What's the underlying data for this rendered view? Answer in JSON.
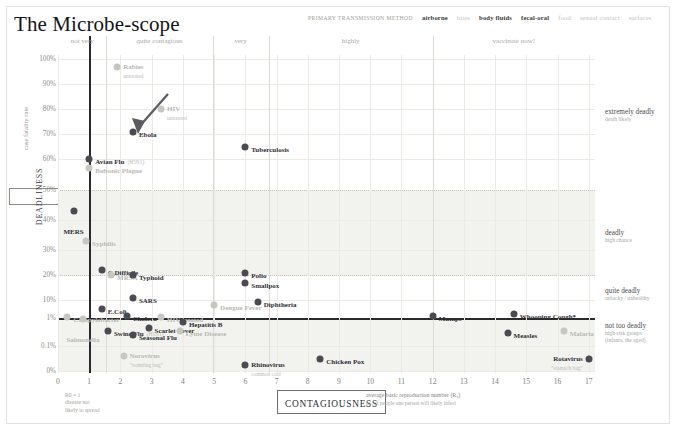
{
  "title": "The Microbe-scope",
  "legend": {
    "title": "PRIMARY TRANSMISSION METHOD",
    "items": [
      {
        "label": "airborne",
        "active": true
      },
      {
        "label": "bites",
        "active": false
      },
      {
        "label": "body fluids",
        "active": true
      },
      {
        "label": "fecal-oral",
        "active": true
      },
      {
        "label": "food",
        "active": false
      },
      {
        "label": "sexual contact",
        "active": false
      },
      {
        "label": "surfaces",
        "active": false
      }
    ]
  },
  "axes": {
    "y_title": "case fatality rate",
    "y_box_label": "DEADLINESS",
    "y_ticks": [
      "100%",
      "90%",
      "80%",
      "70%",
      "60%",
      "50%",
      "40%",
      "30%",
      "20%",
      "10%",
      "1%",
      "0.1%",
      "0%"
    ],
    "x_box_label": "CONTAGIOUSNESS",
    "x_ticks": [
      "0",
      "1",
      "2",
      "3",
      "4",
      "5",
      "6",
      "7",
      "8",
      "9",
      "10",
      "11",
      "12",
      "13",
      "14",
      "15",
      "16",
      "17"
    ],
    "x_note_line1": "average basic reproduction number (R₀)",
    "x_note_line2": "no. of people one person will likely infect",
    "r0_note": "R0 = 1\ndisease not\nlikely to spread"
  },
  "contagiousness_bands": [
    {
      "label": "not very",
      "x0": 0,
      "x1": 1.55
    },
    {
      "label": "quite contagious",
      "x0": 1.55,
      "x1": 4.95
    },
    {
      "label": "very",
      "x0": 4.95,
      "x1": 6.75
    },
    {
      "label": "highly",
      "x0": 6.75,
      "x1": 12.0
    },
    {
      "label": "vaccinate now!",
      "x0": 12.0,
      "x1": 17.2
    }
  ],
  "deadliness_bands": [
    {
      "label": "extremely deadly",
      "sub": "death likely"
    },
    {
      "label": "deadly",
      "sub": "high chance"
    },
    {
      "label": "quite deadly",
      "sub": "unlucky / unhealthy"
    },
    {
      "label": "not too deadly",
      "sub": "high-risk groups\n(infants, the aged)"
    }
  ],
  "chart_data": {
    "type": "scatter",
    "title": "The Microbe-scope",
    "xlabel": "CONTAGIOUSNESS — average basic reproduction number (R₀)",
    "ylabel": "DEADLINESS — case fatality rate",
    "xlim": [
      0,
      17.2
    ],
    "ylabel_scale": "piecewise: 0%, 0.1%, 1%, then linear 10%–100%",
    "grid": true,
    "legend_position": "top-right",
    "annotation_arrow_target": "Ebola",
    "points": [
      {
        "name": "Rabies",
        "sub": "untreated",
        "x": 1.9,
        "y_label": "97%",
        "transmission": "bites",
        "active": false,
        "label_side": "right"
      },
      {
        "name": "HIV",
        "sub": "untreated",
        "x": 3.3,
        "y_label": "80%",
        "transmission": "sexual contact",
        "active": false,
        "label_side": "right"
      },
      {
        "name": "Ebola",
        "sub": "",
        "x": 2.4,
        "y_label": "71%",
        "transmission": "body fluids",
        "active": true,
        "label_side": "right"
      },
      {
        "name": "Tuberculosis",
        "sub": "",
        "x": 6.0,
        "y_label": "65%",
        "transmission": "airborne",
        "active": true,
        "label_side": "right"
      },
      {
        "name": "Avian Flu",
        "sub": "(H5N1)",
        "x": 1.0,
        "y_label": "60%",
        "transmission": "airborne",
        "active": true,
        "label_side": "right"
      },
      {
        "name": "Bubonic Plague",
        "sub": "",
        "x": 1.0,
        "y_label": "57%",
        "transmission": "bites",
        "active": false,
        "label_side": "right"
      },
      {
        "name": "MERS",
        "sub": "",
        "x": 0.5,
        "y_label": "43%",
        "transmission": "airborne",
        "active": true,
        "label_side": "below"
      },
      {
        "name": "Syphilis",
        "sub": "",
        "x": 0.9,
        "y_label": "33%",
        "transmission": "sexual contact",
        "active": false,
        "label_side": "right"
      },
      {
        "name": "C.Difficile",
        "sub": "",
        "x": 1.4,
        "y_label": "22%",
        "transmission": "fecal-oral",
        "active": true,
        "label_side": "right"
      },
      {
        "name": "MRSA",
        "sub": "",
        "x": 1.7,
        "y_label": "20%",
        "transmission": "surfaces",
        "active": false,
        "label_side": "right"
      },
      {
        "name": "Typhoid",
        "sub": "",
        "x": 2.4,
        "y_label": "20%",
        "transmission": "fecal-oral",
        "active": true,
        "label_side": "right"
      },
      {
        "name": "Polio",
        "sub": "",
        "x": 6.0,
        "y_label": "21%",
        "transmission": "fecal-oral",
        "active": true,
        "label_side": "right"
      },
      {
        "name": "Smallpox",
        "sub": "",
        "x": 6.0,
        "y_label": "17%",
        "transmission": "airborne",
        "active": true,
        "label_side": "right"
      },
      {
        "name": "SARS",
        "sub": "",
        "x": 2.4,
        "y_label": "11%",
        "transmission": "airborne",
        "active": true,
        "label_side": "right"
      },
      {
        "name": "Dengue Fever",
        "sub": "",
        "x": 5.0,
        "y_label": "5%",
        "transmission": "bites",
        "active": false,
        "label_side": "right"
      },
      {
        "name": "Diphtheria",
        "sub": "",
        "x": 6.4,
        "y_label": "8%",
        "transmission": "airborne",
        "active": true,
        "label_side": "right"
      },
      {
        "name": "E.Coli",
        "sub": "",
        "x": 1.4,
        "y_label": "3%",
        "transmission": "fecal-oral",
        "active": true,
        "label_side": "right"
      },
      {
        "name": "Campylobacter",
        "sub": "",
        "x": 0.3,
        "y_label": "1.2%",
        "transmission": "food",
        "active": false,
        "label_side": "right"
      },
      {
        "name": "Salmonella",
        "sub": "",
        "x": 0.8,
        "y_label": "0.9%",
        "transmission": "food",
        "active": false,
        "label_side": "below"
      },
      {
        "name": "Cholera",
        "sub": "",
        "x": 2.2,
        "y_label": "1.3%",
        "transmission": "fecal-oral",
        "active": true,
        "label_side": "right"
      },
      {
        "name": "HIV treated",
        "sub": "",
        "x": 3.3,
        "y_label": "1.2%",
        "transmission": "sexual contact",
        "active": false,
        "label_side": "right"
      },
      {
        "name": "Mumps",
        "sub": "",
        "x": 12.0,
        "y_label": "1.3%",
        "transmission": "airborne",
        "active": true,
        "label_side": "right"
      },
      {
        "name": "Whooping Cough*",
        "sub": "",
        "x": 14.6,
        "y_label": "1.6%",
        "transmission": "airborne",
        "active": true,
        "label_side": "right"
      },
      {
        "name": "Hepatitis B",
        "sub": "",
        "x": 4.0,
        "y_label": "0.7%",
        "transmission": "body fluids",
        "active": true,
        "label_side": "right"
      },
      {
        "name": "Scarlet Fever",
        "sub": "",
        "x": 2.9,
        "y_label": "0.45%",
        "transmission": "airborne",
        "active": true,
        "label_side": "right"
      },
      {
        "name": "Swine Flu",
        "sub": "(H1N1)",
        "x": 1.6,
        "y_label": "0.35%",
        "transmission": "airborne",
        "active": true,
        "label_side": "right"
      },
      {
        "name": "Lyme Disease",
        "sub": "",
        "x": 3.9,
        "y_label": "0.35%",
        "transmission": "bites",
        "active": false,
        "label_side": "right"
      },
      {
        "name": "Seasonal Flu",
        "sub": "",
        "x": 2.4,
        "y_label": "0.25%",
        "transmission": "airborne",
        "active": true,
        "label_side": "right"
      },
      {
        "name": "Measles",
        "sub": "",
        "x": 14.4,
        "y_label": "0.3%",
        "transmission": "airborne",
        "active": true,
        "label_side": "right"
      },
      {
        "name": "Malaria",
        "sub": "",
        "x": 16.2,
        "y_label": "0.35%",
        "transmission": "bites",
        "active": false,
        "label_side": "right"
      },
      {
        "name": "Norovirus",
        "sub": "\"vomiting bug\"",
        "x": 2.1,
        "y_label": "0.03%",
        "transmission": "fecal-oral",
        "active": false,
        "label_side": "right"
      },
      {
        "name": "Chicken Pox",
        "sub": "",
        "x": 8.4,
        "y_label": "0.02%",
        "transmission": "airborne",
        "active": true,
        "label_side": "right"
      },
      {
        "name": "Rhinovirus",
        "sub": "common cold",
        "x": 6.0,
        "y_label": "0.01%",
        "transmission": "airborne",
        "active": true,
        "label_side": "right"
      },
      {
        "name": "Rotavirus",
        "sub": "\"stomach bug\"",
        "x": 17.0,
        "y_label": "0.02%",
        "transmission": "fecal-oral",
        "active": true,
        "label_side": "left"
      }
    ]
  },
  "colors": {
    "dot_active": "#4a4a50",
    "dot_inactive": "#c7c7c2",
    "band_fill": "#f2f2ef",
    "axis": "#2a2a2e",
    "grid": "#eceae4"
  }
}
